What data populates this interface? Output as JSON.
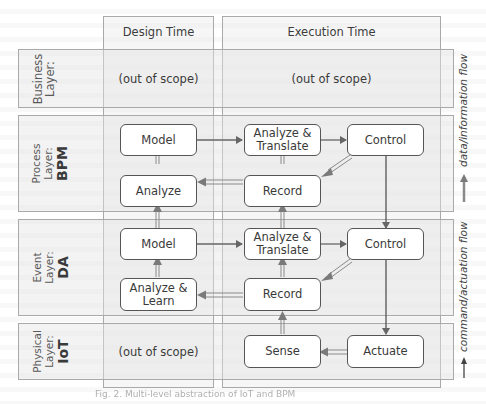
{
  "columns": {
    "design_time": "Design Time",
    "execution_time": "Execution Time"
  },
  "layers": [
    {
      "name": "business",
      "line1": "Business",
      "line2": "Layer:",
      "abbr": ""
    },
    {
      "name": "process",
      "line1": "Process",
      "line2": "Layer:",
      "abbr": "BPM"
    },
    {
      "name": "event",
      "line1": "Event",
      "line2": "Layer:",
      "abbr": "DA"
    },
    {
      "name": "physical",
      "line1": "Physical",
      "line2": "Layer:",
      "abbr": "IoT"
    }
  ],
  "out_of_scope": "(out of scope)",
  "boxes": {
    "bpm_model": "Model",
    "bpm_analyze": "Analyze",
    "bpm_analyze_translate_1": "Analyze &",
    "bpm_analyze_translate_2": "Translate",
    "bpm_record": "Record",
    "bpm_control": "Control",
    "da_model": "Model",
    "da_analyze_learn_1": "Analyze &",
    "da_analyze_learn_2": "Learn",
    "da_analyze_translate_1": "Analyze &",
    "da_analyze_translate_2": "Translate",
    "da_record": "Record",
    "da_control": "Control",
    "iot_sense": "Sense",
    "iot_actuate": "Actuate"
  },
  "legend": {
    "data_flow": "data/information flow",
    "command_flow": "command/actuation flow"
  },
  "colors": {
    "data_arrow": "#8a8a8a",
    "command_arrow": "#555555",
    "box_border": "#555555",
    "panel_border": "#a9a9a9"
  },
  "caption": "Fig. 2. Multi-level abstraction of IoT and BPM"
}
